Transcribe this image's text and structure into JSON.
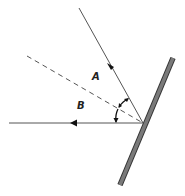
{
  "diagram": {
    "type": "reflection-mirror",
    "labels": {
      "angle_a": "A",
      "angle_b": "B"
    },
    "elements": {
      "incident_ray": "incident ray approaching mirror (arrow toward mirror)",
      "normal": "dashed normal line",
      "reflected_ray": "reflected ray leaving mirror (arrow pointing left)",
      "mirror": "plane mirror (tilted)"
    },
    "colors": {
      "ray": "#555555",
      "mirror_fill": "#777777",
      "mirror_edge": "#333333",
      "arrow": "#111111",
      "label": "#222222"
    }
  }
}
